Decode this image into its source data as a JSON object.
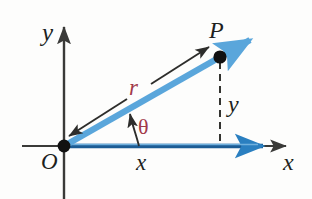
{
  "figure": {
    "background_color": "#fdfdfc",
    "labels": {
      "y_axis": "y",
      "x_axis": "x",
      "origin": "O",
      "point_p": "P",
      "radius": "r",
      "angle": "θ",
      "x_leg": "x",
      "y_leg": "y"
    },
    "colors": {
      "ray_blue": "#5aa6db",
      "axis_blue_dark": "#1c5c94",
      "axis_black": "#3a3a38",
      "label_maroon": "#a23a4b",
      "label_black": "#201f1e",
      "dot_black": "#111111"
    },
    "geometry": {
      "origin": {
        "x": 64,
        "y": 146
      },
      "point_p": {
        "x": 220,
        "y": 57
      },
      "ray_arrow_tip": {
        "x": 256,
        "y": 36
      },
      "x_axis_arrow_tip": {
        "x": 290,
        "y": 146
      },
      "y_axis_arrow_tip": {
        "x": 64,
        "y": 24
      },
      "x_axis_blue_arrow_tip": {
        "x": 270,
        "y": 146
      },
      "dashed_segment": {
        "from": {
          "x": 220,
          "y": 60
        },
        "to": {
          "x": 220,
          "y": 146
        }
      },
      "r_measure_arrow": {
        "from": {
          "x": 67,
          "y": 138
        },
        "to": {
          "x": 211,
          "y": 46
        }
      },
      "angle_arc_arrow": {
        "from": {
          "x": 139,
          "y": 146
        },
        "to": {
          "x": 130,
          "y": 110
        }
      }
    },
    "icons": {
      "origin_dot": "filled-circle-icon",
      "point_dot": "filled-circle-icon",
      "ray_arrowhead": "arrowhead-icon",
      "axis_arrowhead": "arrowhead-icon"
    }
  }
}
